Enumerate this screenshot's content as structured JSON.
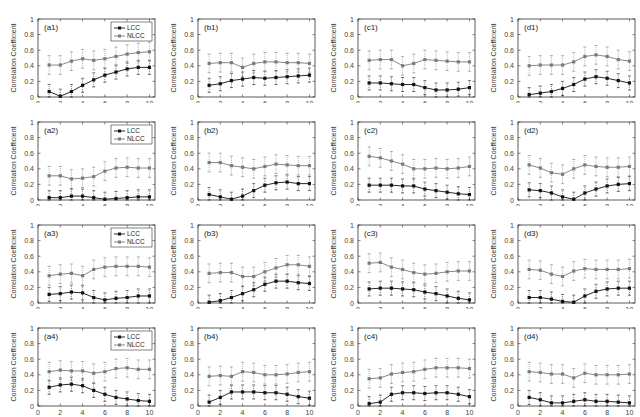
{
  "figure": {
    "xlabel": "Quarters",
    "ylabel": "Correlation Coefficient",
    "legend": [
      "LCC",
      "NLCC"
    ],
    "colors": {
      "LCC": "#111111",
      "NLCC": "#7a7a7a",
      "axes": "#333333",
      "tick_text": "#444444"
    },
    "xticks": [
      0,
      2,
      4,
      6,
      8,
      10
    ],
    "yticks": [
      0,
      0.2,
      0.4,
      0.6,
      0.8,
      1
    ]
  },
  "chart_data": [
    {
      "type": "line",
      "title": "(a1)",
      "x": [
        1,
        2,
        3,
        4,
        5,
        6,
        7,
        8,
        9,
        10
      ],
      "legend": true,
      "xlim": [
        0,
        10.5
      ],
      "ylim": [
        0,
        1
      ],
      "xlabel": "",
      "ylabel": "Correlation Coefficient",
      "series": [
        {
          "name": "LCC",
          "values": [
            0.07,
            0.01,
            0.07,
            0.15,
            0.22,
            0.28,
            0.32,
            0.36,
            0.38,
            0.38
          ]
        },
        {
          "name": "NLCC",
          "values": [
            0.41,
            0.41,
            0.46,
            0.49,
            0.47,
            0.49,
            0.52,
            0.55,
            0.57,
            0.58
          ]
        }
      ]
    },
    {
      "type": "line",
      "title": "(b1)",
      "x": [
        1,
        2,
        3,
        4,
        5,
        6,
        7,
        8,
        9,
        10
      ],
      "legend": false,
      "xlim": [
        0,
        10.5
      ],
      "ylim": [
        0,
        1
      ],
      "xlabel": "",
      "ylabel": "Correlation Coefficient",
      "series": [
        {
          "name": "LCC",
          "values": [
            0.15,
            0.17,
            0.21,
            0.23,
            0.25,
            0.24,
            0.25,
            0.26,
            0.27,
            0.28
          ]
        },
        {
          "name": "NLCC",
          "values": [
            0.43,
            0.44,
            0.44,
            0.38,
            0.43,
            0.45,
            0.45,
            0.44,
            0.44,
            0.43
          ]
        }
      ]
    },
    {
      "type": "line",
      "title": "(c1)",
      "x": [
        1,
        2,
        3,
        4,
        5,
        6,
        7,
        8,
        9,
        10
      ],
      "legend": false,
      "xlim": [
        0,
        10.5
      ],
      "ylim": [
        0,
        1
      ],
      "xlabel": "",
      "ylabel": "Correlation Coefficient",
      "series": [
        {
          "name": "LCC",
          "values": [
            0.18,
            0.18,
            0.17,
            0.16,
            0.16,
            0.12,
            0.09,
            0.09,
            0.1,
            0.12
          ]
        },
        {
          "name": "NLCC",
          "values": [
            0.47,
            0.48,
            0.48,
            0.4,
            0.43,
            0.48,
            0.47,
            0.46,
            0.45,
            0.45
          ]
        }
      ]
    },
    {
      "type": "line",
      "title": "(d1)",
      "x": [
        1,
        2,
        3,
        4,
        5,
        6,
        7,
        8,
        9,
        10
      ],
      "legend": false,
      "xlim": [
        0,
        10.5
      ],
      "ylim": [
        0,
        1
      ],
      "xlabel": "",
      "ylabel": "Correlation Coefficient",
      "series": [
        {
          "name": "LCC",
          "values": [
            0.03,
            0.05,
            0.07,
            0.11,
            0.16,
            0.23,
            0.26,
            0.24,
            0.21,
            0.18
          ]
        },
        {
          "name": "NLCC",
          "values": [
            0.4,
            0.41,
            0.41,
            0.41,
            0.45,
            0.52,
            0.54,
            0.52,
            0.48,
            0.46
          ]
        }
      ]
    },
    {
      "type": "line",
      "title": "(a2)",
      "x": [
        1,
        2,
        3,
        4,
        5,
        6,
        7,
        8,
        9,
        10
      ],
      "legend": true,
      "xlim": [
        0,
        10.5
      ],
      "ylim": [
        0,
        1
      ],
      "xlabel": "",
      "ylabel": "Correlation Coefficient",
      "series": [
        {
          "name": "LCC",
          "values": [
            0.03,
            0.03,
            0.05,
            0.05,
            0.03,
            0.01,
            0.02,
            0.03,
            0.04,
            0.04
          ]
        },
        {
          "name": "NLCC",
          "values": [
            0.31,
            0.31,
            0.27,
            0.28,
            0.3,
            0.37,
            0.41,
            0.42,
            0.41,
            0.41
          ]
        }
      ]
    },
    {
      "type": "line",
      "title": "(b2)",
      "x": [
        1,
        2,
        3,
        4,
        5,
        6,
        7,
        8,
        9,
        10
      ],
      "legend": false,
      "xlim": [
        0,
        10.5
      ],
      "ylim": [
        0,
        1
      ],
      "xlabel": "",
      "ylabel": "Correlation Coefficient",
      "series": [
        {
          "name": "LCC",
          "values": [
            0.07,
            0.04,
            0.01,
            0.05,
            0.12,
            0.19,
            0.22,
            0.23,
            0.21,
            0.21
          ]
        },
        {
          "name": "NLCC",
          "values": [
            0.48,
            0.48,
            0.44,
            0.42,
            0.4,
            0.43,
            0.46,
            0.45,
            0.44,
            0.44
          ]
        }
      ]
    },
    {
      "type": "line",
      "title": "(c2)",
      "x": [
        1,
        2,
        3,
        4,
        5,
        6,
        7,
        8,
        9,
        10
      ],
      "legend": false,
      "xlim": [
        0,
        10.5
      ],
      "ylim": [
        0,
        1
      ],
      "xlabel": "",
      "ylabel": "Correlation Coefficient",
      "series": [
        {
          "name": "LCC",
          "values": [
            0.19,
            0.19,
            0.19,
            0.18,
            0.18,
            0.14,
            0.12,
            0.1,
            0.08,
            0.07
          ]
        },
        {
          "name": "NLCC",
          "values": [
            0.56,
            0.54,
            0.5,
            0.46,
            0.4,
            0.4,
            0.41,
            0.4,
            0.41,
            0.43
          ]
        }
      ]
    },
    {
      "type": "line",
      "title": "(d2)",
      "x": [
        1,
        2,
        3,
        4,
        5,
        6,
        7,
        8,
        9,
        10
      ],
      "legend": false,
      "xlim": [
        0,
        10.5
      ],
      "ylim": [
        0,
        1
      ],
      "xlabel": "",
      "ylabel": "Correlation Coefficient",
      "series": [
        {
          "name": "LCC",
          "values": [
            0.13,
            0.12,
            0.09,
            0.04,
            0.01,
            0.09,
            0.14,
            0.18,
            0.2,
            0.21
          ]
        },
        {
          "name": "NLCC",
          "values": [
            0.45,
            0.41,
            0.35,
            0.33,
            0.4,
            0.45,
            0.43,
            0.42,
            0.42,
            0.43
          ]
        }
      ]
    },
    {
      "type": "line",
      "title": "(a3)",
      "x": [
        1,
        2,
        3,
        4,
        5,
        6,
        7,
        8,
        9,
        10
      ],
      "legend": true,
      "xlim": [
        0,
        10.5
      ],
      "ylim": [
        0,
        1
      ],
      "xlabel": "",
      "ylabel": "Correlation Coefficient",
      "series": [
        {
          "name": "LCC",
          "values": [
            0.11,
            0.12,
            0.14,
            0.13,
            0.07,
            0.04,
            0.06,
            0.07,
            0.09,
            0.09
          ]
        },
        {
          "name": "NLCC",
          "values": [
            0.35,
            0.37,
            0.38,
            0.35,
            0.43,
            0.46,
            0.47,
            0.47,
            0.47,
            0.46
          ]
        }
      ]
    },
    {
      "type": "line",
      "title": "(b3)",
      "x": [
        1,
        2,
        3,
        4,
        5,
        6,
        7,
        8,
        9,
        10
      ],
      "legend": false,
      "xlim": [
        0,
        10.5
      ],
      "ylim": [
        0,
        1
      ],
      "xlabel": "",
      "ylabel": "Correlation Coefficient",
      "series": [
        {
          "name": "LCC",
          "values": [
            0.01,
            0.03,
            0.07,
            0.12,
            0.17,
            0.24,
            0.28,
            0.28,
            0.26,
            0.25
          ]
        },
        {
          "name": "NLCC",
          "values": [
            0.38,
            0.39,
            0.39,
            0.34,
            0.34,
            0.4,
            0.45,
            0.49,
            0.49,
            0.47
          ]
        }
      ]
    },
    {
      "type": "line",
      "title": "(c3)",
      "x": [
        1,
        2,
        3,
        4,
        5,
        6,
        7,
        8,
        9,
        10
      ],
      "legend": false,
      "xlim": [
        0,
        10.5
      ],
      "ylim": [
        0,
        1
      ],
      "xlabel": "",
      "ylabel": "Correlation Coefficient",
      "series": [
        {
          "name": "LCC",
          "values": [
            0.18,
            0.19,
            0.19,
            0.18,
            0.17,
            0.14,
            0.12,
            0.09,
            0.06,
            0.04
          ]
        },
        {
          "name": "NLCC",
          "values": [
            0.51,
            0.52,
            0.46,
            0.43,
            0.39,
            0.37,
            0.38,
            0.4,
            0.41,
            0.41
          ]
        }
      ]
    },
    {
      "type": "line",
      "title": "(d3)",
      "x": [
        1,
        2,
        3,
        4,
        5,
        6,
        7,
        8,
        9,
        10
      ],
      "legend": false,
      "xlim": [
        0,
        10.5
      ],
      "ylim": [
        0,
        1
      ],
      "xlabel": "",
      "ylabel": "Correlation Coefficient",
      "series": [
        {
          "name": "LCC",
          "values": [
            0.07,
            0.07,
            0.05,
            0.02,
            0.01,
            0.09,
            0.15,
            0.18,
            0.19,
            0.19
          ]
        },
        {
          "name": "NLCC",
          "values": [
            0.43,
            0.42,
            0.37,
            0.34,
            0.41,
            0.44,
            0.43,
            0.43,
            0.43,
            0.44
          ]
        }
      ]
    },
    {
      "type": "line",
      "title": "(a4)",
      "x": [
        1,
        2,
        3,
        4,
        5,
        6,
        7,
        8,
        9,
        10
      ],
      "legend": true,
      "xlim": [
        0,
        10.5
      ],
      "ylim": [
        0,
        1
      ],
      "xlabel": "Quarters",
      "ylabel": "Correlation Coefficient",
      "series": [
        {
          "name": "LCC",
          "values": [
            0.24,
            0.27,
            0.28,
            0.26,
            0.2,
            0.15,
            0.11,
            0.09,
            0.07,
            0.06
          ]
        },
        {
          "name": "NLCC",
          "values": [
            0.44,
            0.46,
            0.45,
            0.45,
            0.42,
            0.44,
            0.48,
            0.49,
            0.47,
            0.47
          ]
        }
      ]
    },
    {
      "type": "line",
      "title": "(b4)",
      "x": [
        1,
        2,
        3,
        4,
        5,
        6,
        7,
        8,
        9,
        10
      ],
      "legend": false,
      "xlim": [
        0,
        10.5
      ],
      "ylim": [
        0,
        1
      ],
      "xlabel": "Quarters",
      "ylabel": "Correlation Coefficient",
      "series": [
        {
          "name": "LCC",
          "values": [
            0.05,
            0.11,
            0.18,
            0.18,
            0.18,
            0.17,
            0.17,
            0.15,
            0.12,
            0.1
          ]
        },
        {
          "name": "NLCC",
          "values": [
            0.38,
            0.39,
            0.38,
            0.44,
            0.43,
            0.4,
            0.4,
            0.41,
            0.43,
            0.44
          ]
        }
      ]
    },
    {
      "type": "line",
      "title": "(c4)",
      "x": [
        1,
        2,
        3,
        4,
        5,
        6,
        7,
        8,
        9,
        10
      ],
      "legend": false,
      "xlim": [
        0,
        10.5
      ],
      "ylim": [
        0,
        1
      ],
      "xlabel": "Quarters",
      "ylabel": "Correlation Coefficient",
      "series": [
        {
          "name": "LCC",
          "values": [
            0.03,
            0.05,
            0.15,
            0.17,
            0.17,
            0.16,
            0.17,
            0.17,
            0.15,
            0.12
          ]
        },
        {
          "name": "NLCC",
          "values": [
            0.35,
            0.36,
            0.41,
            0.43,
            0.44,
            0.47,
            0.49,
            0.49,
            0.49,
            0.48
          ]
        }
      ]
    },
    {
      "type": "line",
      "title": "(d4)",
      "x": [
        1,
        2,
        3,
        4,
        5,
        6,
        7,
        8,
        9,
        10
      ],
      "legend": false,
      "xlim": [
        0,
        10.5
      ],
      "ylim": [
        0,
        1
      ],
      "xlabel": "Quarters",
      "ylabel": "Correlation Coefficient",
      "series": [
        {
          "name": "LCC",
          "values": [
            0.11,
            0.08,
            0.04,
            0.04,
            0.06,
            0.08,
            0.06,
            0.06,
            0.05,
            0.04
          ]
        },
        {
          "name": "NLCC",
          "values": [
            0.44,
            0.43,
            0.41,
            0.41,
            0.36,
            0.42,
            0.4,
            0.4,
            0.4,
            0.41
          ]
        }
      ]
    }
  ]
}
